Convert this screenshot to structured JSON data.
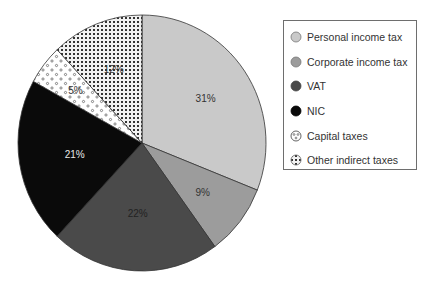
{
  "chart_data": {
    "type": "pie",
    "title": "",
    "start_angle_deg": 0,
    "direction": "clockwise",
    "categories": [
      "Personal income tax",
      "Corporate income tax",
      "VAT",
      "NIC",
      "Capital taxes",
      "Other indirect taxes"
    ],
    "values": [
      31,
      9,
      22,
      21,
      5,
      12
    ],
    "labels": [
      "31%",
      "9%",
      "22%",
      "21%",
      "5%",
      "12%"
    ],
    "fills": [
      "#c9c9c9",
      "#9c9c9c",
      "#4a4a4a",
      "#0a0a0a",
      "pattern-circles",
      "pattern-dots"
    ],
    "legend_position": "right"
  },
  "legend": {
    "items": [
      {
        "label": "Personal income tax"
      },
      {
        "label": "Corporate income tax"
      },
      {
        "label": "VAT"
      },
      {
        "label": "NIC"
      },
      {
        "label": "Capital taxes"
      },
      {
        "label": "Other indirect taxes"
      }
    ]
  }
}
